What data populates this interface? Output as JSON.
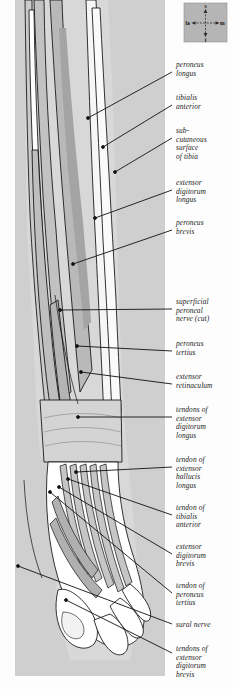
{
  "figure": {
    "panel_color": "#cfcfcf",
    "page_color": "#fdfdfd",
    "line_color": "#111111",
    "muscle_fill": "#bdbdbd",
    "muscle_fill_dark": "#9a9a9a",
    "tendon_fill": "#ffffff",
    "bone_fill": "#f4f4f4"
  },
  "compass": {
    "name": "orientation-compass",
    "superior": "s",
    "inferior": "i",
    "lateral": "la",
    "medial": "m",
    "box_color": "#b5b5b5"
  },
  "labels": [
    {
      "id": "peroneus-longus",
      "text": "peroneus\nlongus",
      "x": 176,
      "y": 61,
      "lx": 172,
      "ly": 72,
      "px": 88,
      "py": 118
    },
    {
      "id": "tibialis-anterior",
      "text": "tibialis\nanterior",
      "x": 176,
      "y": 94,
      "lx": 172,
      "ly": 105,
      "px": 103,
      "py": 147
    },
    {
      "id": "subcutaneous-surface-tibia",
      "text": "sub-\ncutaneous\nsurface\nof tibia",
      "x": 176,
      "y": 127,
      "lx": 172,
      "ly": 138,
      "px": 115,
      "py": 172
    },
    {
      "id": "extensor-digitorum-longus",
      "text": "extensor\ndigitorum\nlongus",
      "x": 176,
      "y": 179,
      "lx": 172,
      "ly": 190,
      "px": 95,
      "py": 218
    },
    {
      "id": "peroneus-brevis",
      "text": "peroneus\nbrevis",
      "x": 176,
      "y": 219,
      "lx": 172,
      "ly": 230,
      "px": 73,
      "py": 264
    },
    {
      "id": "superficial-peroneal-nerve",
      "text": "superficial\nperoneal\nnerve (cut)",
      "x": 176,
      "y": 298,
      "lx": 172,
      "ly": 309,
      "px": 60,
      "py": 310
    },
    {
      "id": "peroneus-tertius",
      "text": "peroneus\ntertius",
      "x": 176,
      "y": 340,
      "lx": 172,
      "ly": 351,
      "px": 77,
      "py": 346
    },
    {
      "id": "extensor-retinaculum",
      "text": "extensor\nretinaculum",
      "x": 176,
      "y": 373,
      "lx": 172,
      "ly": 384,
      "px": 81,
      "py": 372
    },
    {
      "id": "tendons-ext-dig-longus",
      "text": "tendons of\nextensor\ndigitorum\nlongus",
      "x": 176,
      "y": 406,
      "lx": 172,
      "ly": 417,
      "px": 78,
      "py": 417
    },
    {
      "id": "tendon-ext-hallucis-longus",
      "text": "tendon of\nextensor\nhallucis\nlongus",
      "x": 176,
      "y": 456,
      "lx": 172,
      "ly": 467,
      "px": 76,
      "py": 472
    },
    {
      "id": "tendon-tibialis-anterior",
      "text": "tendon of\ntibialis\nanterior",
      "x": 176,
      "y": 504,
      "lx": 172,
      "ly": 515,
      "px": 68,
      "py": 479
    },
    {
      "id": "extensor-digitorum-brevis",
      "text": "extensor\ndigitorum\nbrevis",
      "x": 176,
      "y": 543,
      "lx": 172,
      "ly": 554,
      "px": 59,
      "py": 487
    },
    {
      "id": "tendon-peroneus-tertius",
      "text": "tendon of\nperoneus\ntertius",
      "x": 176,
      "y": 582,
      "lx": 172,
      "ly": 593,
      "px": 50,
      "py": 492
    },
    {
      "id": "sural-nerve",
      "text": "sural nerve",
      "x": 176,
      "y": 621,
      "lx": 172,
      "ly": 624,
      "px": 18,
      "py": 566
    },
    {
      "id": "tendons-ext-dig-brevis",
      "text": "tendons of\nextensor\ndigitorum\nbrevis",
      "x": 176,
      "y": 645,
      "lx": 172,
      "ly": 653,
      "px": 66,
      "py": 600
    }
  ]
}
